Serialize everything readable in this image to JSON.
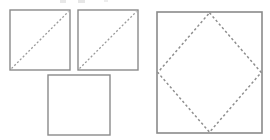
{
  "figure": {
    "background_color": "#ffffff",
    "stroke_color": "#8a8a8a",
    "dash_color": "#9a9a9a",
    "canvas": {
      "width": 270,
      "height": 140
    },
    "shape_count": 4,
    "shapes": [
      {
        "id": "square-top-left",
        "label": "Square 1",
        "type": "square",
        "x": 10,
        "y": 10,
        "width": 60,
        "height": 60,
        "filled": false,
        "diagonal": "bottom-left-to-top-right",
        "diagonal_style": "dashed"
      },
      {
        "id": "square-top-right",
        "label": "Square 2",
        "type": "square",
        "x": 78,
        "y": 10,
        "width": 60,
        "height": 60,
        "filled": false,
        "diagonal": "bottom-left-to-top-right",
        "diagonal_style": "dashed"
      },
      {
        "id": "square-bottom-middle",
        "label": "Square 3",
        "type": "square",
        "x": 48,
        "y": 75,
        "width": 62,
        "height": 60,
        "filled": false,
        "diagonal": "none",
        "diagonal_style": "none"
      },
      {
        "id": "square-large-right",
        "label": "Square 4",
        "type": "square",
        "x": 157,
        "y": 12,
        "width": 105,
        "height": 121,
        "filled": false,
        "inscribed": "diamond",
        "inscribed_style": "dashed",
        "inscribed_vertices": "side-midpoints"
      }
    ],
    "crop_artifacts": [
      {
        "id": "artifact-1",
        "x": 60,
        "y": 0,
        "width": 6,
        "height": 3
      },
      {
        "id": "artifact-2",
        "x": 78,
        "y": 0,
        "width": 7,
        "height": 3
      },
      {
        "id": "artifact-3",
        "x": 104,
        "y": 0,
        "width": 4,
        "height": 2
      }
    ]
  },
  "chart_data": {
    "type": "diagram",
    "elements": [
      {
        "name": "Square 1",
        "diagonal": "dashed",
        "inscribed": "none"
      },
      {
        "name": "Square 2",
        "diagonal": "dashed",
        "inscribed": "none"
      },
      {
        "name": "Square 3",
        "diagonal": "none",
        "inscribed": "none"
      },
      {
        "name": "Square 4",
        "diagonal": "none",
        "inscribed": "dashed diamond"
      }
    ]
  }
}
